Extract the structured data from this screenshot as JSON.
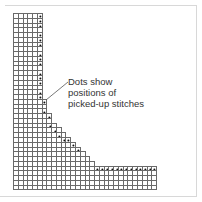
{
  "diagram": {
    "caption": "Dots show\npositions of\npicked-up stitches",
    "grid": {
      "cell_size": 4.77,
      "columns": 30,
      "rows": 37,
      "line_color": "#6a6a6a",
      "dot_color": "#111111",
      "row_widths": [
        6,
        6,
        6,
        6,
        6,
        6,
        6,
        6,
        6,
        6,
        6,
        6,
        6,
        6,
        6,
        6,
        6,
        6,
        7,
        7,
        7,
        8,
        8,
        9,
        10,
        11,
        12,
        13,
        14,
        15,
        16,
        17,
        30,
        30,
        30,
        30,
        30
      ],
      "dots": [
        [
          0,
          5
        ],
        [
          1,
          5
        ],
        [
          2,
          5
        ],
        [
          4,
          5
        ],
        [
          5,
          5
        ],
        [
          6,
          5
        ],
        [
          8,
          5
        ],
        [
          9,
          5
        ],
        [
          10,
          5
        ],
        [
          12,
          5
        ],
        [
          13,
          5
        ],
        [
          14,
          5
        ],
        [
          16,
          5
        ],
        [
          17,
          5
        ],
        [
          18,
          6
        ],
        [
          20,
          6
        ],
        [
          21,
          7
        ],
        [
          23,
          7
        ],
        [
          24,
          8
        ],
        [
          25,
          9
        ],
        [
          26,
          10
        ],
        [
          26,
          11
        ],
        [
          27,
          12
        ],
        [
          28,
          13
        ],
        [
          28,
          14
        ],
        [
          29,
          15
        ],
        [
          30,
          16
        ],
        [
          32,
          17
        ],
        [
          32,
          18
        ],
        [
          32,
          19
        ],
        [
          32,
          20
        ],
        [
          32,
          21
        ],
        [
          32,
          22
        ],
        [
          32,
          23
        ],
        [
          32,
          24
        ],
        [
          32,
          25
        ],
        [
          32,
          26
        ],
        [
          32,
          27
        ],
        [
          32,
          28
        ],
        [
          32,
          29
        ]
      ]
    },
    "leader_line": {
      "x1": 68,
      "y1": 82,
      "x2": 46,
      "y2": 100,
      "color": "#555555"
    }
  }
}
